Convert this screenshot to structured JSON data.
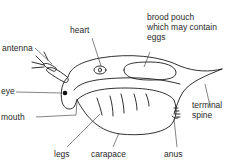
{
  "diagram": {
    "labels": {
      "antenna": "antenna",
      "heart": "heart",
      "brood_pouch": "brood pouch\nwhich may contain\neggs",
      "eye": "eye",
      "mouth": "mouth",
      "terminal_spine": "terminal\nspine",
      "legs": "legs",
      "carapace": "carapace",
      "anus": "anus"
    },
    "colors": {
      "line": "#1a1a1a",
      "text": "#2a2a2a",
      "background": "#ffffff"
    }
  }
}
